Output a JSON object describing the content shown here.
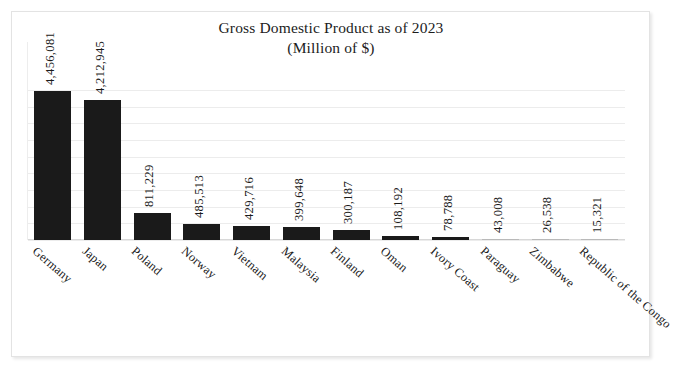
{
  "chart_data": {
    "type": "bar",
    "title": "Gross Domestic Product as of 2023",
    "subtitle": "(Million of $)",
    "xlabel": "",
    "ylabel": "",
    "ylim": [
      0,
      4500000
    ],
    "grid": true,
    "gridline_count": 10,
    "legend": "none",
    "orientation": "vertical",
    "bar_color": "#1a1a1a",
    "categories": [
      "Germany",
      "Japan",
      "Poland",
      "Norway",
      "Vietnam",
      "Malaysia",
      "Finland",
      "Oman",
      "Ivory Coast",
      "Paraguay",
      "Zimbabwe",
      "Republic of the Congo"
    ],
    "values": [
      4456081,
      4212945,
      811229,
      485513,
      429716,
      399648,
      300187,
      108192,
      78788,
      43008,
      26538,
      15321
    ],
    "value_labels": [
      "4,456,081",
      "4,212,945",
      "811,229",
      "485,513",
      "429,716",
      "399,648",
      "300,187",
      "108,192",
      "78,788",
      "43,008",
      "26,538",
      "15,321"
    ]
  },
  "style": {
    "background": "#ffffff",
    "grid_color": "#ececec",
    "text_color": "#1b1b1b",
    "border_color": "#e3e3e3"
  }
}
